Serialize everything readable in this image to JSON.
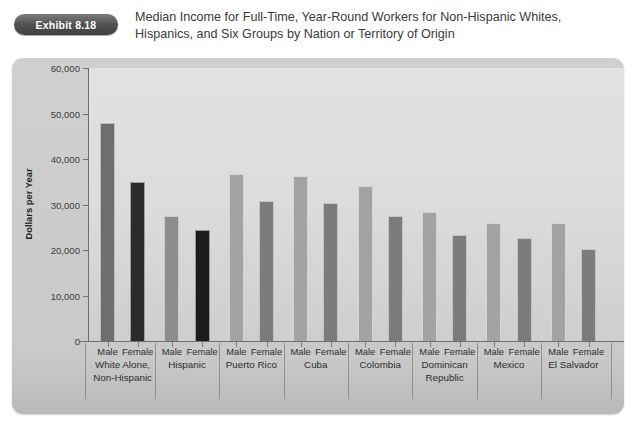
{
  "exhibit": {
    "badge_label": "Exhibit 8.18"
  },
  "title": {
    "line1": "Median Income for Full-Time, Year-Round Workers for Non-Hispanic Whites,",
    "line2": "Hispanics, and Six Groups by Nation or Territory of Origin"
  },
  "colors": {
    "frame_bg": "#c9c9c9",
    "panel_bg": "#dcdcdc",
    "axis": "#6f6f6f",
    "badge_dark": "#3e3e3e",
    "bar_male_dark": "#6e6e6e",
    "bar_female_black": "#2b2b2b",
    "bar_male_mid": "#8d8d8d",
    "bar_female_near_black": "#1c1c1c",
    "bar_male_light": "#a3a3a3",
    "bar_female_gray": "#7c7c7c"
  },
  "chart_data": {
    "type": "bar",
    "title": "Median Income for Full-Time, Year-Round Workers for Non-Hispanic Whites, Hispanics, and Six Groups by Nation or Territory of Origin",
    "xlabel": "",
    "ylabel": "Dollars per Year",
    "ylim": [
      0,
      60000
    ],
    "ytick_values": [
      0,
      10000,
      20000,
      30000,
      40000,
      50000,
      60000
    ],
    "ytick_labels": [
      "0",
      "10,000",
      "20,000",
      "30,000",
      "40,000",
      "50,000",
      "60,000"
    ],
    "grid": false,
    "legend": "none",
    "categories": [
      "White Alone, Non-Hispanic",
      "Hispanic",
      "Puerto Rico",
      "Cuba",
      "Colombia",
      "Dominican Republic",
      "Mexico",
      "El Salvador"
    ],
    "gender_labels": [
      "Male",
      "Female"
    ],
    "bars": [
      {
        "group": "White Alone, Non-Hispanic",
        "gender": "Male",
        "value": 48000,
        "color": "#6e6e6e"
      },
      {
        "group": "White Alone, Non-Hispanic",
        "gender": "Female",
        "value": 35000,
        "color": "#2b2b2b"
      },
      {
        "group": "Hispanic",
        "gender": "Male",
        "value": 27400,
        "color": "#8d8d8d"
      },
      {
        "group": "Hispanic",
        "gender": "Female",
        "value": 24500,
        "color": "#1c1c1c"
      },
      {
        "group": "Puerto Rico",
        "gender": "Male",
        "value": 36800,
        "color": "#a3a3a3"
      },
      {
        "group": "Puerto Rico",
        "gender": "Female",
        "value": 30800,
        "color": "#7c7c7c"
      },
      {
        "group": "Cuba",
        "gender": "Male",
        "value": 36200,
        "color": "#a3a3a3"
      },
      {
        "group": "Cuba",
        "gender": "Female",
        "value": 30300,
        "color": "#7c7c7c"
      },
      {
        "group": "Colombia",
        "gender": "Male",
        "value": 34000,
        "color": "#a3a3a3"
      },
      {
        "group": "Colombia",
        "gender": "Female",
        "value": 27500,
        "color": "#7c7c7c"
      },
      {
        "group": "Dominican Republic",
        "gender": "Male",
        "value": 28400,
        "color": "#a3a3a3"
      },
      {
        "group": "Dominican Republic",
        "gender": "Female",
        "value": 23400,
        "color": "#7c7c7c"
      },
      {
        "group": "Mexico",
        "gender": "Male",
        "value": 26000,
        "color": "#a3a3a3"
      },
      {
        "group": "Mexico",
        "gender": "Female",
        "value": 22700,
        "color": "#7c7c7c"
      },
      {
        "group": "El Salvador",
        "gender": "Male",
        "value": 26000,
        "color": "#a3a3a3"
      },
      {
        "group": "El Salvador",
        "gender": "Female",
        "value": 20200,
        "color": "#7c7c7c"
      }
    ]
  }
}
